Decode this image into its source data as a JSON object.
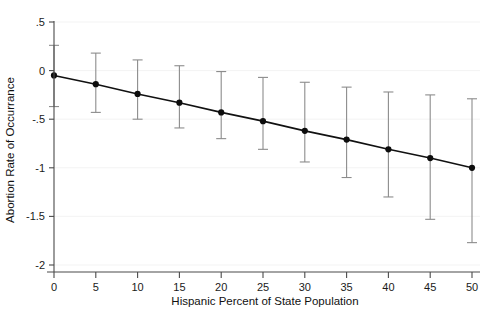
{
  "chart_data": {
    "type": "line",
    "title": "",
    "subtitle": "",
    "xlabel": "Hispanic Percent of State Population",
    "ylabel": "Abortion Rate of Occurrance",
    "xlim": [
      0,
      50
    ],
    "ylim": [
      -2,
      0.5
    ],
    "xticks": [
      0,
      5,
      10,
      15,
      20,
      25,
      30,
      35,
      40,
      45,
      50
    ],
    "xticklabels": [
      "0",
      "5",
      "10",
      "15",
      "20",
      "25",
      "30",
      "35",
      "40",
      "45",
      "50"
    ],
    "yticks": [
      0.5,
      0,
      -0.5,
      -1,
      -1.5,
      -2
    ],
    "yticklabels": [
      ".5",
      "0",
      "-.5",
      "-1",
      "-1.5",
      "-2"
    ],
    "grid": "faint horizontal gridlines at y ticks",
    "legend": "none",
    "legend_position": "none",
    "marker": "filled circle",
    "errorbar": "95% confidence interval with caps",
    "x": [
      0,
      5,
      10,
      15,
      20,
      25,
      30,
      35,
      40,
      45,
      50
    ],
    "values": [
      -0.05,
      -0.14,
      -0.24,
      -0.33,
      -0.43,
      -0.52,
      -0.62,
      -0.71,
      -0.81,
      -0.9,
      -1.0
    ],
    "ci_lower": [
      -0.37,
      -0.43,
      -0.5,
      -0.59,
      -0.7,
      -0.81,
      -0.94,
      -1.1,
      -1.3,
      -1.53,
      -1.77
    ],
    "ci_upper": [
      0.26,
      0.18,
      0.11,
      0.05,
      -0.01,
      -0.07,
      -0.12,
      -0.17,
      -0.22,
      -0.25,
      -0.29
    ],
    "series": [
      {
        "name": "Abortion Rate of Occurrance",
        "x": [
          0,
          5,
          10,
          15,
          20,
          25,
          30,
          35,
          40,
          45,
          50
        ],
        "values": [
          -0.05,
          -0.14,
          -0.24,
          -0.33,
          -0.43,
          -0.52,
          -0.62,
          -0.71,
          -0.81,
          -0.9,
          -1.0
        ]
      }
    ],
    "colors": {
      "line": "#111111",
      "marker": "#0d0d0d",
      "errorbar": "#8c8c8c",
      "axis": "#4a4a4a",
      "grid": "#f2f2f2",
      "background": "#ffffff"
    }
  }
}
